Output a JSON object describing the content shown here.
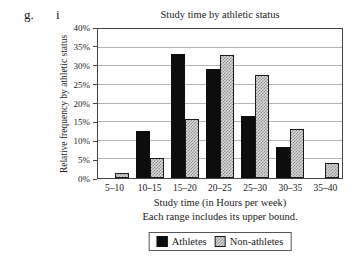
{
  "page": {
    "exercise_label_g": "g.",
    "exercise_label_i": "i"
  },
  "chart_data": {
    "type": "bar",
    "title": "Study time by athletic status",
    "xlabel": "Study time (in Hours per week)",
    "xlabel_note": "Each range includes its upper bound.",
    "ylabel": "Relative frequency by athletic status",
    "categories": [
      "5–10",
      "10–15",
      "15–20",
      "20–25",
      "25–30",
      "30–35",
      "35–40"
    ],
    "series": [
      {
        "name": "Athletes",
        "style": "solid",
        "color": "#0d0d0d",
        "values": [
          0,
          12.5,
          33.3,
          29.2,
          16.7,
          8.3,
          0
        ]
      },
      {
        "name": "Non-athletes",
        "style": "checker",
        "color": "#d9d9d9",
        "values": [
          1.3,
          5.3,
          15.8,
          32.9,
          27.6,
          13.2,
          3.9
        ]
      }
    ],
    "ylim": [
      0,
      40
    ],
    "ytick_step": 5,
    "ytick_suffix": "%",
    "grid": true,
    "legend_position": "bottom"
  }
}
